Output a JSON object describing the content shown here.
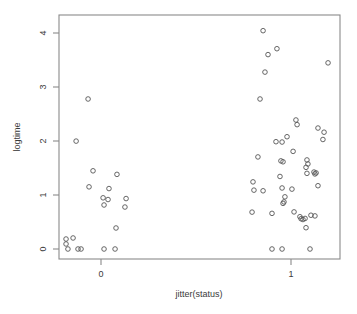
{
  "chart_data": {
    "type": "scatter",
    "title": "",
    "xlabel": "jitter(status)",
    "ylabel": "logtime",
    "xlim": [
      -0.28,
      1.26
    ],
    "ylim": [
      -0.12,
      4.2
    ],
    "xticks": [
      0,
      1
    ],
    "xtick_labels": [
      "0",
      "1"
    ],
    "yticks": [
      0,
      1,
      2,
      3,
      4
    ],
    "ytick_labels": [
      "0",
      "1",
      "2",
      "3",
      "4"
    ],
    "grid": false,
    "legend": null,
    "marker": "open-circle",
    "marker_color": "#555555",
    "frame_color": "#8a8a8a",
    "points": [
      {
        "x": -0.184,
        "y": 0.185
      },
      {
        "x": -0.184,
        "y": 0.093
      },
      {
        "x": -0.147,
        "y": 0.204
      },
      {
        "x": -0.174,
        "y": 0.0
      },
      {
        "x": -0.121,
        "y": 0.0
      },
      {
        "x": -0.105,
        "y": 0.0
      },
      {
        "x": -0.131,
        "y": 1.998
      },
      {
        "x": -0.068,
        "y": 2.778
      },
      {
        "x": -0.042,
        "y": 1.448
      },
      {
        "x": -0.063,
        "y": 1.151
      },
      {
        "x": 0.011,
        "y": 0.948
      },
      {
        "x": 0.016,
        "y": 0.815
      },
      {
        "x": 0.037,
        "y": 0.916
      },
      {
        "x": 0.042,
        "y": 1.119
      },
      {
        "x": 0.084,
        "y": 1.382
      },
      {
        "x": 0.016,
        "y": 0.0
      },
      {
        "x": 0.074,
        "y": 0.0
      },
      {
        "x": 0.079,
        "y": 0.389
      },
      {
        "x": 0.132,
        "y": 0.934
      },
      {
        "x": 0.126,
        "y": 0.777
      },
      {
        "x": 0.853,
        "y": 4.043
      },
      {
        "x": 0.863,
        "y": 3.276
      },
      {
        "x": 0.879,
        "y": 3.6
      },
      {
        "x": 0.926,
        "y": 3.709
      },
      {
        "x": 1.195,
        "y": 3.447
      },
      {
        "x": 0.837,
        "y": 2.778
      },
      {
        "x": 1.026,
        "y": 2.389
      },
      {
        "x": 1.032,
        "y": 2.303
      },
      {
        "x": 1.142,
        "y": 2.24
      },
      {
        "x": 1.174,
        "y": 2.163
      },
      {
        "x": 1.168,
        "y": 2.028
      },
      {
        "x": 0.921,
        "y": 1.987
      },
      {
        "x": 0.953,
        "y": 1.981
      },
      {
        "x": 0.979,
        "y": 2.079
      },
      {
        "x": 1.011,
        "y": 1.808
      },
      {
        "x": 0.826,
        "y": 1.705
      },
      {
        "x": 0.947,
        "y": 1.632
      },
      {
        "x": 0.958,
        "y": 1.615
      },
      {
        "x": 0.942,
        "y": 1.343
      },
      {
        "x": 1.084,
        "y": 1.649
      },
      {
        "x": 1.089,
        "y": 1.575
      },
      {
        "x": 1.079,
        "y": 1.512
      },
      {
        "x": 1.084,
        "y": 1.401
      },
      {
        "x": 1.121,
        "y": 1.425
      },
      {
        "x": 1.132,
        "y": 1.409
      },
      {
        "x": 1.126,
        "y": 1.39
      },
      {
        "x": 0.8,
        "y": 1.243
      },
      {
        "x": 0.805,
        "y": 1.09
      },
      {
        "x": 0.853,
        "y": 1.078
      },
      {
        "x": 0.953,
        "y": 1.13
      },
      {
        "x": 1.005,
        "y": 1.109
      },
      {
        "x": 1.142,
        "y": 1.172
      },
      {
        "x": 0.968,
        "y": 0.966
      },
      {
        "x": 0.963,
        "y": 0.872
      },
      {
        "x": 0.958,
        "y": 0.845
      },
      {
        "x": 0.795,
        "y": 0.683
      },
      {
        "x": 0.9,
        "y": 0.66
      },
      {
        "x": 1.016,
        "y": 0.687
      },
      {
        "x": 1.047,
        "y": 0.598
      },
      {
        "x": 1.053,
        "y": 0.56
      },
      {
        "x": 1.063,
        "y": 0.546
      },
      {
        "x": 1.074,
        "y": 0.566
      },
      {
        "x": 1.105,
        "y": 0.625
      },
      {
        "x": 1.126,
        "y": 0.613
      },
      {
        "x": 1.079,
        "y": 0.394
      },
      {
        "x": 0.9,
        "y": 0.0
      },
      {
        "x": 0.953,
        "y": 0.0
      },
      {
        "x": 1.1,
        "y": 0.0
      }
    ]
  }
}
